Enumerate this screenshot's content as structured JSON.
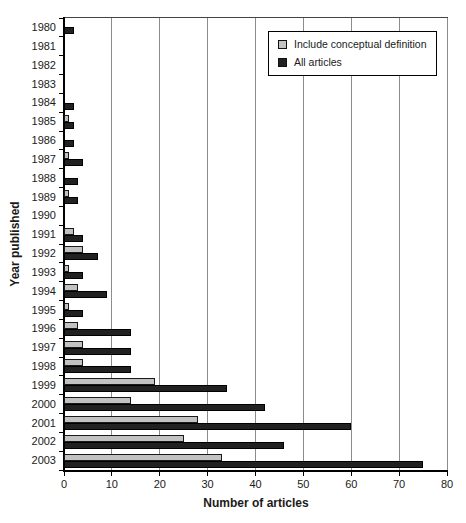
{
  "chart_data": {
    "type": "bar",
    "orientation": "horizontal",
    "xlabel": "Number of articles",
    "ylabel": "Year published",
    "xlim": [
      0,
      80
    ],
    "xticks": [
      0,
      10,
      20,
      30,
      40,
      50,
      60,
      70,
      80
    ],
    "grid": true,
    "legend_position": "top-right",
    "categories": [
      "1980",
      "1981",
      "1982",
      "1983",
      "1984",
      "1985",
      "1986",
      "1987",
      "1988",
      "1989",
      "1990",
      "1991",
      "1992",
      "1993",
      "1994",
      "1995",
      "1996",
      "1997",
      "1998",
      "1999",
      "2000",
      "2001",
      "2002",
      "2003"
    ],
    "series": [
      {
        "name": "Include conceptual definition",
        "color": "#c2c2c2",
        "border": "#1a1a1a",
        "values": [
          0,
          0,
          0,
          0,
          0,
          1,
          0,
          1,
          0,
          1,
          0,
          2,
          4,
          1,
          3,
          1,
          3,
          4,
          4,
          19,
          14,
          28,
          25,
          33
        ]
      },
      {
        "name": "All articles",
        "color": "#212121",
        "border": "#000000",
        "values": [
          2,
          0,
          0,
          0,
          2,
          2,
          2,
          4,
          3,
          3,
          0,
          4,
          7,
          4,
          9,
          4,
          14,
          14,
          14,
          34,
          42,
          60,
          46,
          75
        ]
      }
    ]
  },
  "colors": {
    "background": "#ffffff",
    "gridline": "#8c8c8c",
    "axis": "#000000",
    "text": "#1a1a1a"
  }
}
